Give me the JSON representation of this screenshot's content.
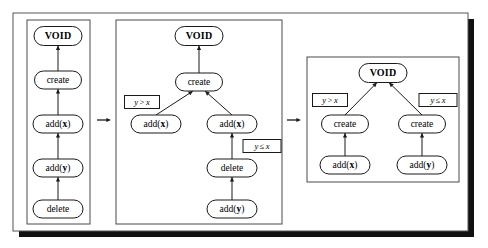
{
  "figure": {
    "background": "#ffffff",
    "frame": {
      "x": 13,
      "y": 13,
      "width": 455,
      "height": 218,
      "shadow_offset": 6,
      "shadow_color": "#111111"
    }
  },
  "labels": {
    "void": "VOID",
    "create": "create",
    "delete": "delete",
    "add_x_prefix": "add(",
    "add_x_arg": "x",
    "add_y_arg": "y",
    "add_suffix": ")",
    "cond_gt_left": "y",
    "cond_gt_op": ">",
    "cond_gt_right": "x",
    "cond_le_left": "y",
    "cond_le_op": "≤",
    "cond_le_right": "x"
  },
  "transitions": [
    {
      "name": "arrow-panel1-to-panel2",
      "x1": 97,
      "y1": 120,
      "x2": 111,
      "y2": 120
    },
    {
      "name": "arrow-panel2-to-panel3",
      "x1": 287,
      "y1": 120,
      "x2": 301,
      "y2": 120
    }
  ],
  "panels": [
    {
      "id": "panel-1",
      "name": "panel-initial-chain",
      "box": {
        "x": 27,
        "y": 20,
        "width": 63,
        "height": 204
      },
      "nodes": [
        {
          "id": "p1-void",
          "name": "node-void",
          "label": "VOID",
          "bold": true,
          "x": 58,
          "y": 36,
          "w": 48,
          "h": 19
        },
        {
          "id": "p1-create",
          "name": "node-create",
          "label": "create",
          "bold": false,
          "x": 58,
          "y": 80,
          "w": 47,
          "h": 18
        },
        {
          "id": "p1-addx",
          "name": "node-add-x",
          "label": "add(x)",
          "arg": "x",
          "x": 58,
          "y": 124,
          "w": 50,
          "h": 18
        },
        {
          "id": "p1-addy",
          "name": "node-add-y",
          "label": "add(y)",
          "arg": "y",
          "x": 58,
          "y": 168,
          "w": 50,
          "h": 18
        },
        {
          "id": "p1-delete",
          "name": "node-delete",
          "label": "delete",
          "bold": false,
          "x": 58,
          "y": 209,
          "w": 50,
          "h": 18
        }
      ],
      "edges": [
        {
          "from": "p1-create",
          "to": "p1-void",
          "name": "edge-create-to-void"
        },
        {
          "from": "p1-addx",
          "to": "p1-create",
          "name": "edge-addx-to-create"
        },
        {
          "from": "p1-addy",
          "to": "p1-addx",
          "name": "edge-addy-to-addx"
        },
        {
          "from": "p1-delete",
          "to": "p1-addy",
          "name": "edge-delete-to-addy"
        }
      ],
      "conditions": []
    },
    {
      "id": "panel-2",
      "name": "panel-split-tree",
      "box": {
        "x": 116,
        "y": 20,
        "width": 166,
        "height": 204
      },
      "nodes": [
        {
          "id": "p2-void",
          "name": "node-void",
          "label": "VOID",
          "bold": true,
          "x": 199,
          "y": 36,
          "w": 48,
          "h": 19
        },
        {
          "id": "p2-create",
          "name": "node-create",
          "label": "create",
          "bold": false,
          "x": 199,
          "y": 82,
          "w": 47,
          "h": 18
        },
        {
          "id": "p2-addx-l",
          "name": "node-add-x-left",
          "label": "add(x)",
          "arg": "x",
          "x": 156,
          "y": 124,
          "w": 50,
          "h": 18
        },
        {
          "id": "p2-addx-r",
          "name": "node-add-x-right",
          "label": "add(x)",
          "arg": "x",
          "x": 232,
          "y": 124,
          "w": 50,
          "h": 18
        },
        {
          "id": "p2-delete",
          "name": "node-delete",
          "label": "delete",
          "bold": false,
          "x": 232,
          "y": 168,
          "w": 50,
          "h": 18
        },
        {
          "id": "p2-addy",
          "name": "node-add-y",
          "label": "add(y)",
          "arg": "y",
          "x": 232,
          "y": 209,
          "w": 50,
          "h": 18
        }
      ],
      "edges": [
        {
          "from": "p2-create",
          "to": "p2-void",
          "name": "edge-create-to-void"
        },
        {
          "from": "p2-addx-l",
          "to": "p2-create",
          "name": "edge-addx-left-to-create"
        },
        {
          "from": "p2-addx-r",
          "to": "p2-create",
          "name": "edge-addx-right-to-create"
        },
        {
          "from": "p2-delete",
          "to": "p2-addx-r",
          "name": "edge-delete-to-addx"
        },
        {
          "from": "p2-addy",
          "to": "p2-delete",
          "name": "edge-addy-to-delete"
        }
      ],
      "conditions": [
        {
          "id": "p2-cond-gt",
          "name": "condition-label-y-gt-x",
          "type": "gt",
          "x": 142,
          "y": 102,
          "w": 35,
          "h": 13
        },
        {
          "id": "p2-cond-le",
          "name": "condition-label-y-le-x",
          "type": "le",
          "x": 262,
          "y": 146,
          "w": 38,
          "h": 13
        }
      ]
    },
    {
      "id": "panel-3",
      "name": "panel-balanced-tree",
      "box": {
        "x": 307,
        "y": 57,
        "width": 152,
        "height": 125
      },
      "nodes": [
        {
          "id": "p3-void",
          "name": "node-void",
          "label": "VOID",
          "bold": true,
          "x": 383,
          "y": 73,
          "w": 48,
          "h": 19
        },
        {
          "id": "p3-cr-l",
          "name": "node-create-left",
          "label": "create",
          "bold": false,
          "x": 345,
          "y": 124,
          "w": 47,
          "h": 18
        },
        {
          "id": "p3-cr-r",
          "name": "node-create-right",
          "label": "create",
          "bold": false,
          "x": 422,
          "y": 124,
          "w": 47,
          "h": 18
        },
        {
          "id": "p3-addx",
          "name": "node-add-x",
          "label": "add(x)",
          "arg": "x",
          "x": 345,
          "y": 165,
          "w": 50,
          "h": 18
        },
        {
          "id": "p3-addy",
          "name": "node-add-y",
          "label": "add(y)",
          "arg": "y",
          "x": 422,
          "y": 165,
          "w": 50,
          "h": 18
        }
      ],
      "edges": [
        {
          "from": "p3-cr-l",
          "to": "p3-void",
          "name": "edge-create-left-to-void"
        },
        {
          "from": "p3-cr-r",
          "to": "p3-void",
          "name": "edge-create-right-to-void"
        },
        {
          "from": "p3-addx",
          "to": "p3-cr-l",
          "name": "edge-addx-to-create-left"
        },
        {
          "from": "p3-addy",
          "to": "p3-cr-r",
          "name": "edge-addy-to-create-right"
        }
      ],
      "conditions": [
        {
          "id": "p3-cond-gt",
          "name": "condition-label-y-gt-x",
          "type": "gt",
          "x": 330,
          "y": 100,
          "w": 35,
          "h": 13
        },
        {
          "id": "p3-cond-le",
          "name": "condition-label-y-le-x",
          "type": "le",
          "x": 438,
          "y": 100,
          "w": 38,
          "h": 13
        }
      ]
    }
  ]
}
